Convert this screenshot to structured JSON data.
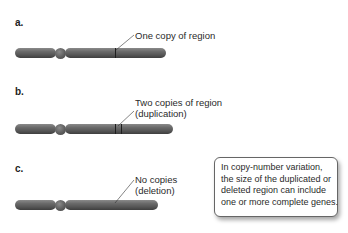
{
  "panels": [
    {
      "label": "a.",
      "annotation": [
        "One copy of region"
      ],
      "copies": 1
    },
    {
      "label": "b.",
      "annotation": [
        "Two copies of region",
        "(duplication)"
      ],
      "copies": 2
    },
    {
      "label": "c.",
      "annotation": [
        "No copies",
        "(deletion)"
      ],
      "copies": 0
    }
  ],
  "callout": {
    "lines": [
      "In copy-number variation,",
      "the size of the duplicated or",
      "deleted region can include",
      "one or more complete genes."
    ]
  },
  "colors": {
    "chromosome": "#5e5e5e",
    "band": "#1e1e1e",
    "text": "#2a2a2a"
  }
}
